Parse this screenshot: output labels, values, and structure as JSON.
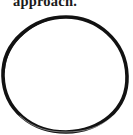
{
  "document": {
    "kind": "scanned-page-fragment",
    "background_color": "#ffffff",
    "ink_color": "#121212",
    "width_px": 133,
    "height_px": 135
  },
  "caption": {
    "text": "approach.",
    "clipped": "top",
    "color": "#1a1a1a"
  },
  "figure": {
    "name": "hand-drawn-circle",
    "shape": "circle",
    "fill": "none",
    "stroke_color": "#121212",
    "stroke_width_px": 3.4,
    "center_x_px": 65,
    "center_y_px": 73,
    "radius_x_px": 62,
    "radius_y_px": 56
  }
}
